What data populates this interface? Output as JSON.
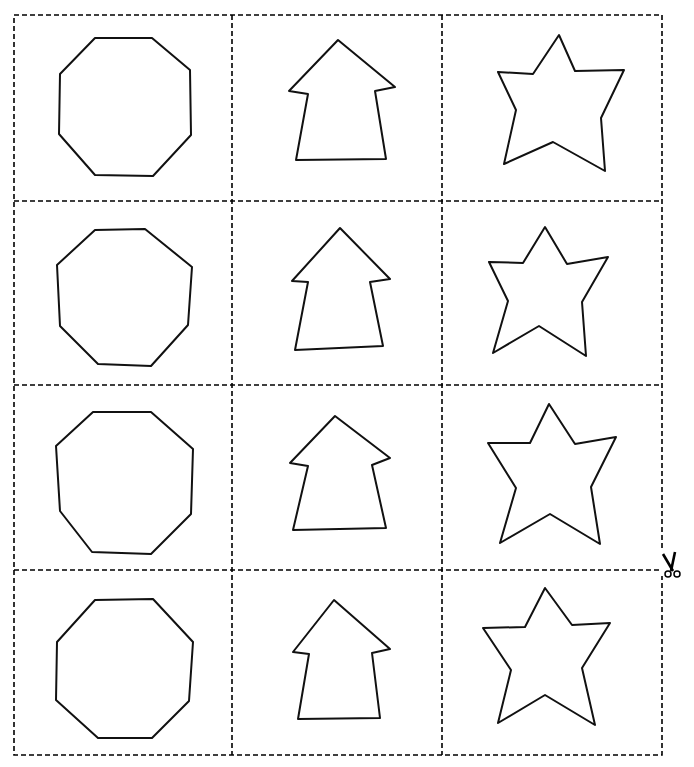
{
  "worksheet": {
    "description": "Cut-out shapes worksheet: 4 rows x 3 columns of outlined shapes separated by dashed cut lines",
    "grid": {
      "rows": 4,
      "columns": 3,
      "left": 14,
      "top": 15,
      "right": 662,
      "bottom": 755,
      "col_lines": [
        232,
        442
      ],
      "row_lines": [
        201,
        385,
        570
      ],
      "line_color": "#000000",
      "dash": "5 3"
    },
    "column_shapes": [
      "octagon",
      "arrow",
      "star"
    ],
    "stroke_color": "#111111",
    "fill_color": "#ffffff",
    "shapes": {
      "octagons": [
        "95,38 152,38 190,70 191,135 153,176 95,175 59,134 60,74",
        "95,230 145,229 192,267 188,325 151,366 98,364 60,326 57,265",
        "93,412 151,412 193,449 191,514 151,554 92,552 60,511 56,446",
        "95,600 153,599 193,642 189,701 152,738 98,738 56,700 57,642"
      ],
      "arrows": [
        "338,40 395,87 375,91 386,159 296,160 308,94 289,91",
        "340,228 390,279 370,282 383,346 295,350 308,282 292,281",
        "335,416 390,458 372,465 386,528 293,530 308,466 290,463",
        "334,600 390,649 372,653 380,718 298,719 309,654 293,652"
      ],
      "stars": [
        "559,35 575,71 624,70 601,118 605,171 553,142 504,164 516,110 498,72 533,74",
        "545,227 567,264 608,257 582,302 586,356 539,326 493,353 508,301 489,262 523,263",
        "549,404 575,444 616,437 591,487 600,544 550,514 500,543 516,488 488,443 530,443",
        "545,588 572,625 610,623 582,668 595,725 545,695 498,723 511,670 483,628 525,627"
      ]
    },
    "scissors": {
      "x": 672,
      "y": 568,
      "glyph": "✂"
    }
  }
}
